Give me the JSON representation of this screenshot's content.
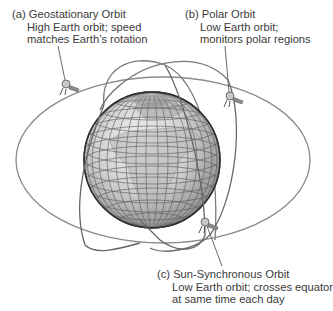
{
  "diagram": {
    "labels": [
      {
        "id": "a",
        "title": "(a) Geostationary Orbit",
        "lines": [
          "High Earth orbit; speed",
          "matches Earth’s rotation"
        ]
      },
      {
        "id": "b",
        "title": "(b) Polar Orbit",
        "lines": [
          "Low Earth orbit;",
          "monitors polar regions"
        ]
      },
      {
        "id": "c",
        "title": "(c) Sun-Synchronous Orbit",
        "lines": [
          "Low Earth orbit; crosses equator",
          "at same time each day"
        ]
      }
    ],
    "elements": {
      "globe": "earth-globe-with-grid",
      "orbits": [
        "geostationary-orbit-ellipse",
        "polar-orbit-ellipse",
        "sun-synchronous-orbit-ellipse"
      ],
      "satellites": [
        "satellite-geostationary",
        "satellite-polar",
        "satellite-sun-synchronous"
      ]
    },
    "colors": {
      "orbit_stroke": "#8a8a8a",
      "globe_fill": "#d4d4d4",
      "globe_grid": "#4a4a4a",
      "text": "#3a3a3a",
      "leader_line": "#5a5a5a"
    }
  }
}
